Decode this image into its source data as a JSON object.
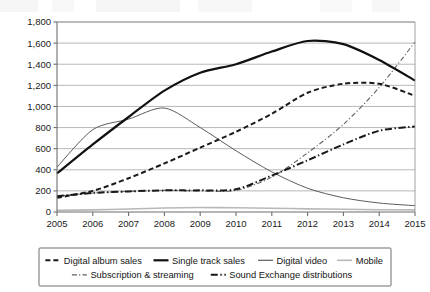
{
  "chart_data": {
    "type": "line",
    "title": "",
    "subtitle": "",
    "xlabel": "",
    "ylabel": "",
    "categories": [
      "2005",
      "2006",
      "2007",
      "2008",
      "2009",
      "2010",
      "2011",
      "2012",
      "2013",
      "2014",
      "2015"
    ],
    "x": [
      2005,
      2006,
      2007,
      2008,
      2009,
      2010,
      2011,
      2012,
      2013,
      2014,
      2015
    ],
    "ylim": [
      0,
      1800
    ],
    "yticks": [
      0,
      200,
      400,
      600,
      800,
      1000,
      1200,
      1400,
      1600,
      1800
    ],
    "ytick_labels": [
      "0",
      "200",
      "400",
      "600",
      "800",
      "1,000",
      "1,200",
      "1,400",
      "1,600",
      "1,800"
    ],
    "grid": true,
    "legend_position": "bottom",
    "series": [
      {
        "name": "Digital album sales",
        "style": "dashed",
        "color": "#1a1a1a",
        "width": 2.0,
        "values": [
          135,
          200,
          320,
          460,
          610,
          760,
          930,
          1130,
          1215,
          1215,
          1100
        ]
      },
      {
        "name": "Single track sales",
        "style": "solid",
        "color": "#111111",
        "width": 2.2,
        "values": [
          365,
          640,
          900,
          1150,
          1320,
          1400,
          1520,
          1620,
          1590,
          1440,
          1245
        ]
      },
      {
        "name": "Digital video",
        "style": "solid-thin",
        "color": "#5c5c5c",
        "width": 1.0,
        "values": [
          425,
          780,
          880,
          985,
          800,
          580,
          380,
          225,
          135,
          85,
          60
        ]
      },
      {
        "name": "Mobile",
        "style": "solid-faint",
        "color": "#b8b8b8",
        "width": 1.6,
        "values": [
          15,
          20,
          28,
          38,
          42,
          40,
          36,
          30,
          26,
          22,
          20
        ]
      },
      {
        "name": "Subscription & streaming",
        "style": "dash-dot-thin",
        "color": "#626262",
        "width": 1.1,
        "values": [
          150,
          180,
          195,
          205,
          200,
          205,
          330,
          560,
          830,
          1180,
          1610
        ]
      },
      {
        "name": "Sound Exchange distributions",
        "style": "dash-dot",
        "color": "#181818",
        "width": 2.0,
        "values": [
          150,
          180,
          195,
          205,
          205,
          215,
          345,
          490,
          640,
          770,
          810
        ]
      }
    ]
  },
  "legend": {
    "row1": [
      {
        "label": "Digital album sales",
        "key": "digital-album-sales"
      },
      {
        "label": "Single track sales",
        "key": "single-track-sales"
      },
      {
        "label": "Digital video",
        "key": "digital-video"
      },
      {
        "label": "Mobile",
        "key": "mobile"
      }
    ],
    "row2": [
      {
        "label": "Subscription & streaming",
        "key": "subscription-streaming"
      },
      {
        "label": "Sound Exchange distributions",
        "key": "sound-exchange-distributions"
      }
    ]
  },
  "axes": {
    "y_labels": [
      "1,800",
      "1,600",
      "1,400",
      "1,200",
      "1,000",
      "800",
      "600",
      "400",
      "200",
      "0"
    ],
    "x_labels": [
      "2005",
      "2006",
      "2007",
      "2008",
      "2009",
      "2010",
      "2011",
      "2012",
      "2013",
      "2014",
      "2015"
    ]
  }
}
